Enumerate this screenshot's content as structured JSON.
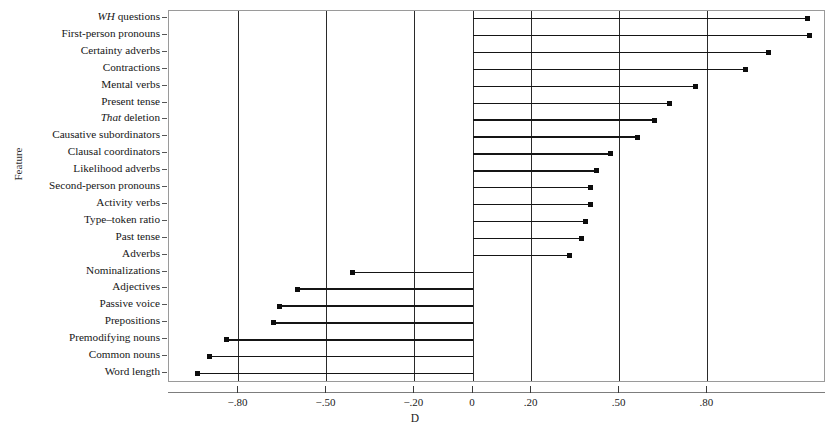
{
  "chart_data": {
    "type": "bar",
    "title": "",
    "xlabel": "D",
    "ylabel": "Feature",
    "xlim": [
      -1.035,
      1.2
    ],
    "grid": true,
    "legend": null,
    "orientation": "horizontal",
    "marker": "filled-square",
    "xticks": [
      -0.8,
      -0.5,
      -0.2,
      0,
      0.2,
      0.5,
      0.8
    ],
    "xticklabels": [
      "−.80",
      "−.50",
      "−.20",
      "0",
      ".20",
      ".50",
      ".80"
    ],
    "categories": [
      "WH questions",
      "First-person pronouns",
      "Certainty adverbs",
      "Contractions",
      "Mental verbs",
      "Present tense",
      "That deletion",
      "Causative subordinators",
      "Clausal coordinators",
      "Likelihood adverbs",
      "Second-person pronouns",
      "Activity verbs",
      "Type–token ratio",
      "Past tense",
      "Adverbs",
      "Nominalizations",
      "Adjectives",
      "Passive voice",
      "Prepositions",
      "Premodifying nouns",
      "Common nouns",
      "Word length"
    ],
    "categories_italic_prefix": {
      "0": "WH",
      "6": "That"
    },
    "values": [
      1.14,
      1.15,
      1.01,
      0.93,
      0.76,
      0.67,
      0.62,
      0.56,
      0.47,
      0.42,
      0.4,
      0.4,
      0.385,
      0.37,
      0.33,
      -0.41,
      -0.6,
      -0.66,
      -0.68,
      -0.84,
      -0.9,
      -0.94
    ]
  },
  "axes": {
    "y_title": "Feature",
    "x_title": "D"
  }
}
